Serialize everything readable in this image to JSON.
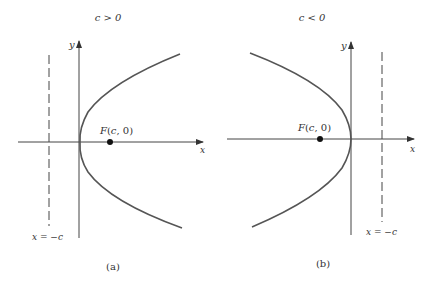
{
  "panels": [
    {
      "id": "a",
      "condition": "c > 0",
      "caption": "(a)",
      "focus_label": "F(c, 0)",
      "directrix_label": "x = −c",
      "x_axis_label": "x",
      "y_axis_label": "y",
      "opening": "right"
    },
    {
      "id": "b",
      "condition": "c < 0",
      "caption": "(b)",
      "focus_label": "F(c, 0)",
      "directrix_label": "x = −c",
      "x_axis_label": "x",
      "y_axis_label": "y",
      "opening": "left"
    }
  ],
  "colors": {
    "curve": "#555555",
    "axes": "#444444",
    "text": "#333333"
  }
}
